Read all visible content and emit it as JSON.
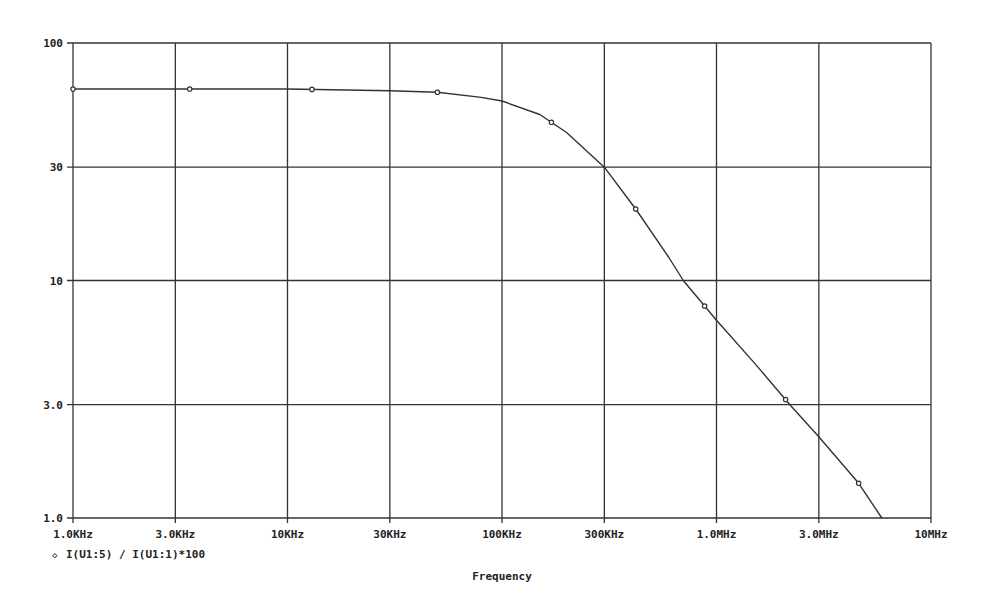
{
  "chart_data": {
    "type": "line",
    "title": "",
    "xlabel": "Frequency",
    "ylabel": "",
    "xscale": "log",
    "yscale": "log",
    "xlim": [
      1000,
      10000000
    ],
    "ylim": [
      1,
      100
    ],
    "grid": true,
    "x_ticks": [
      {
        "value": 1000,
        "label": "1.0KHz"
      },
      {
        "value": 3000,
        "label": "3.0KHz"
      },
      {
        "value": 10000,
        "label": "10KHz"
      },
      {
        "value": 30000,
        "label": "30KHz"
      },
      {
        "value": 100000,
        "label": "100KHz"
      },
      {
        "value": 300000,
        "label": "300KHz"
      },
      {
        "value": 1000000,
        "label": "1.0MHz"
      },
      {
        "value": 3000000,
        "label": "3.0MHz"
      },
      {
        "value": 10000000,
        "label": "10MHz"
      }
    ],
    "y_ticks": [
      {
        "value": 1,
        "label": "1.0"
      },
      {
        "value": 3,
        "label": "3.0"
      },
      {
        "value": 10,
        "label": "10"
      },
      {
        "value": 30,
        "label": "30"
      },
      {
        "value": 100,
        "label": "100"
      }
    ],
    "legend_position": "bottom-left",
    "series": [
      {
        "name": "I(U1:5) / I(U1:1)*100",
        "marker": "◇",
        "color": "#333333",
        "x": [
          1000,
          3000,
          10000,
          30000,
          50000,
          80000,
          100000,
          150000,
          200000,
          300000,
          420000,
          600000,
          700000,
          1000000,
          1500000,
          2200000,
          3000000,
          4600000,
          5900000
        ],
        "y": [
          64,
          64,
          64,
          63,
          62,
          59,
          57,
          50,
          42,
          30,
          20,
          12.5,
          10,
          6.8,
          4.5,
          3.0,
          2.2,
          1.4,
          1.0
        ],
        "markers_x": [
          1000,
          3500,
          13000,
          50000,
          170000,
          420000,
          880000,
          2100000,
          4600000
        ]
      }
    ]
  }
}
